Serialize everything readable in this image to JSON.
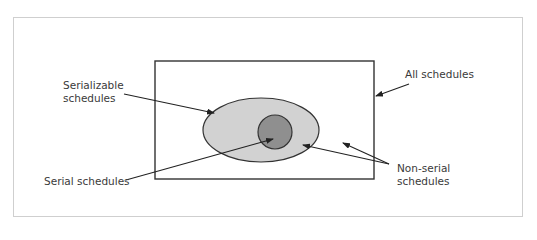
{
  "diagram": {
    "type": "venn-nested-sets",
    "colors": {
      "background": "#ffffff",
      "frame_border": "#cfcfcf",
      "outer_set_fill": "#ffffff",
      "serializable_fill": "#d2d2d2",
      "serial_fill": "#8f8f8f",
      "stroke": "#333333"
    },
    "sets": [
      {
        "id": "all",
        "label": "All schedules",
        "shape": "rectangle"
      },
      {
        "id": "serializable",
        "label": "Serializable\nschedules",
        "shape": "ellipse"
      },
      {
        "id": "serial",
        "label": "Serial schedules",
        "shape": "circle"
      }
    ],
    "annotations": [
      {
        "id": "non-serial",
        "label": "Non-serial\nschedules"
      }
    ]
  }
}
